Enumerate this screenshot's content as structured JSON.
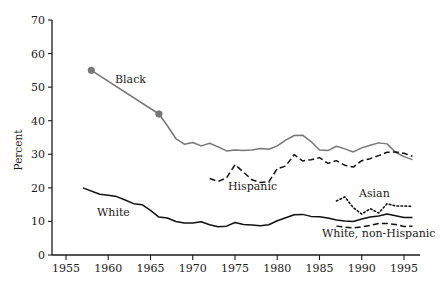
{
  "chart_data": {
    "type": "line",
    "title": "",
    "subtitle": "",
    "xlabel": "",
    "ylabel": "Percent",
    "xlim": [
      1955,
      1996
    ],
    "ylim": [
      0,
      70
    ],
    "yticks": [
      0,
      10,
      20,
      30,
      40,
      50,
      60,
      70
    ],
    "xticks": [
      1955,
      1960,
      1965,
      1970,
      1975,
      1980,
      1985,
      1990,
      1995
    ],
    "grid": false,
    "legend": "inline-labels",
    "series": [
      {
        "name": "Black",
        "label": "Black",
        "style": "solid",
        "color": "#777777",
        "markers": true,
        "marker_points": [
          [
            1958,
            55
          ],
          [
            1966,
            42
          ]
        ],
        "x": [
          1958,
          1966,
          1967,
          1968,
          1969,
          1970,
          1971,
          1972,
          1973,
          1974,
          1975,
          1976,
          1977,
          1978,
          1979,
          1980,
          1981,
          1982,
          1983,
          1984,
          1985,
          1986,
          1987,
          1988,
          1989,
          1990,
          1991,
          1992,
          1993,
          1994,
          1995,
          1996
        ],
        "y": [
          55,
          42,
          38.5,
          34.7,
          33,
          33.5,
          32.5,
          33.3,
          32.2,
          31,
          31.3,
          31.1,
          31.3,
          31.7,
          31.5,
          32.5,
          34.2,
          35.6,
          35.7,
          33.8,
          31.3,
          31.1,
          32.4,
          31.6,
          30.7,
          31.9,
          32.7,
          33.4,
          33.1,
          30.6,
          29.3,
          28.4
        ]
      },
      {
        "name": "Hispanic",
        "label": "Hispanic",
        "style": "dashed",
        "color": "#111111",
        "markers": false,
        "x": [
          1972,
          1973,
          1974,
          1975,
          1976,
          1977,
          1978,
          1979,
          1980,
          1981,
          1982,
          1983,
          1984,
          1985,
          1986,
          1987,
          1988,
          1989,
          1990,
          1991,
          1992,
          1993,
          1994,
          1995,
          1996
        ],
        "y": [
          22.8,
          21.9,
          23,
          26.9,
          24.7,
          22.4,
          21.6,
          21.8,
          25.7,
          26.5,
          29.9,
          28.0,
          28.4,
          29.0,
          27.3,
          28.1,
          26.7,
          26.2,
          28.1,
          28.7,
          29.6,
          30.6,
          30.7,
          30.3,
          29.4
        ]
      },
      {
        "name": "White",
        "label": "White",
        "style": "solid",
        "color": "#111111",
        "markers": false,
        "x": [
          1957,
          1959,
          1960,
          1961,
          1962,
          1963,
          1964,
          1965,
          1966,
          1967,
          1968,
          1969,
          1970,
          1971,
          1972,
          1973,
          1974,
          1975,
          1976,
          1977,
          1978,
          1979,
          1980,
          1981,
          1982,
          1983,
          1984,
          1985,
          1986,
          1987,
          1988,
          1989,
          1990,
          1991,
          1992,
          1993,
          1994,
          1995,
          1996
        ],
        "y": [
          20.0,
          18.1,
          17.8,
          17.4,
          16.4,
          15.3,
          15.0,
          13.3,
          11.3,
          11.0,
          10.0,
          9.5,
          9.5,
          9.9,
          9.0,
          8.4,
          8.6,
          9.7,
          9.1,
          8.9,
          8.7,
          9.0,
          10.2,
          11.1,
          12.0,
          12.1,
          11.5,
          11.4,
          11.0,
          10.4,
          10.1,
          10.0,
          10.7,
          11.3,
          11.6,
          12.2,
          11.7,
          11.2,
          11.2
        ]
      },
      {
        "name": "Asian",
        "label": "Asian",
        "style": "dotted",
        "color": "#111111",
        "markers": false,
        "x": [
          1987,
          1988,
          1989,
          1990,
          1991,
          1992,
          1993,
          1994,
          1995,
          1996
        ],
        "y": [
          16.1,
          17.3,
          14.1,
          12.2,
          13.8,
          12.5,
          15.3,
          14.6,
          14.6,
          14.5
        ]
      },
      {
        "name": "White, non-Hispanic",
        "label": "White, non-Hispanic",
        "style": "dashed",
        "color": "#111111",
        "markers": false,
        "x": [
          1987,
          1988,
          1989,
          1990,
          1991,
          1992,
          1993,
          1994,
          1995,
          1996
        ],
        "y": [
          8.6,
          8.3,
          8.1,
          8.4,
          8.8,
          9.4,
          9.4,
          9.1,
          8.5,
          8.6
        ]
      }
    ]
  },
  "axes": {
    "ylabel": "Percent",
    "ytick_labels": [
      "0",
      "10",
      "20",
      "30",
      "40",
      "50",
      "60",
      "70"
    ],
    "xtick_labels": [
      "1955",
      "1960",
      "1965",
      "1970",
      "1975",
      "1980",
      "1985",
      "1990",
      "1995"
    ]
  },
  "series_labels": {
    "black": "Black",
    "hispanic": "Hispanic",
    "white": "White",
    "asian": "Asian",
    "white_non_hispanic": "White, non-Hispanic"
  },
  "colors": {
    "black_series": "#777777",
    "other_series": "#111111",
    "axis": "#1a1a1a",
    "background": "#ffffff"
  }
}
